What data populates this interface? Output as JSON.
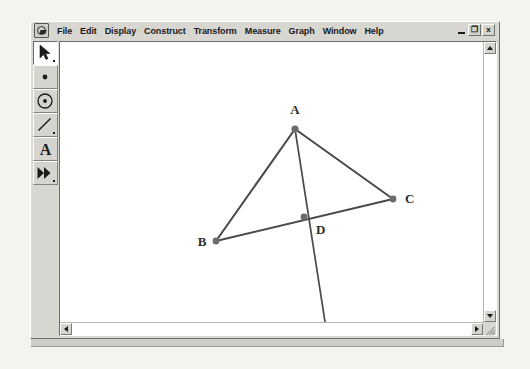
{
  "window": {
    "app_icon": "sketchpad-app-icon",
    "menus": [
      "File",
      "Edit",
      "Display",
      "Construct",
      "Transform",
      "Measure",
      "Graph",
      "Window",
      "Help"
    ],
    "controls": {
      "minimize": "_",
      "restore": "❐",
      "close": "x"
    }
  },
  "toolbar": {
    "tools": [
      {
        "name": "selection-arrow-tool",
        "icon": "arrow-icon",
        "selected": true
      },
      {
        "name": "point-tool",
        "icon": "point-icon",
        "selected": false
      },
      {
        "name": "compass-circle-tool",
        "icon": "circle-icon",
        "selected": false
      },
      {
        "name": "straightedge-segment-tool",
        "icon": "segment-icon",
        "selected": false
      },
      {
        "name": "text-tool",
        "icon": "text-a-icon",
        "label": "A",
        "selected": false
      },
      {
        "name": "custom-transform-tool",
        "icon": "double-arrow-icon",
        "selected": false
      }
    ]
  },
  "scrollbars": {
    "vertical": {
      "up": "scroll-up-arrow",
      "down": "scroll-down-arrow"
    },
    "horizontal": {
      "left": "scroll-left-arrow",
      "right": "scroll-right-arrow"
    }
  },
  "sketch": {
    "stroke_color": "#4a4a4a",
    "point_color": "#6b6b6b",
    "label_color": "#2e2e2e",
    "background": "#ffffff",
    "points": [
      {
        "label": "A",
        "x": 235,
        "y": 87,
        "label_x": 235,
        "label_y": 72
      },
      {
        "label": "B",
        "x": 156,
        "y": 199,
        "label_x": 142,
        "label_y": 204
      },
      {
        "label": "C",
        "x": 333,
        "y": 157,
        "label_x": 345,
        "label_y": 161
      },
      {
        "label": "D",
        "x": 244,
        "y": 175,
        "label_x": 258,
        "label_y": 190
      }
    ],
    "segments": [
      {
        "name": "segment-AB",
        "from": "A",
        "to": "B"
      },
      {
        "name": "segment-AC",
        "from": "A",
        "to": "C"
      },
      {
        "name": "segment-BC",
        "from": "B",
        "to": "C"
      },
      {
        "name": "ray-AD-extended",
        "from": "A",
        "to": "end",
        "end_x": 268,
        "end_y": 299
      }
    ]
  }
}
